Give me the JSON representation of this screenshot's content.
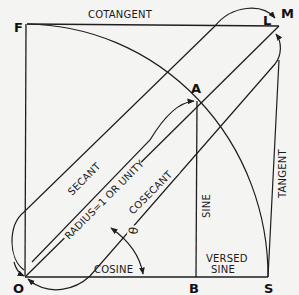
{
  "figure": {
    "type": "trigonometric-functions-diagram",
    "points": {
      "F": "F",
      "O": "O",
      "B": "B",
      "S": "S",
      "A": "A",
      "L": "L",
      "M": "M"
    },
    "labels": {
      "cotangent": "COTANGENT",
      "secant": "SECANT",
      "radius": "RADIUS=1 OR UNITY",
      "cosecant": "COSECANT",
      "sine": "SINE",
      "tangent": "TANGENT",
      "cosine": "COSINE",
      "versed_sine_line1": "VERSED",
      "versed_sine_line2": "SINE",
      "angle": "θ"
    },
    "colors": {
      "ink": "#1e1e1e",
      "paper": "#f4f4f2"
    }
  }
}
